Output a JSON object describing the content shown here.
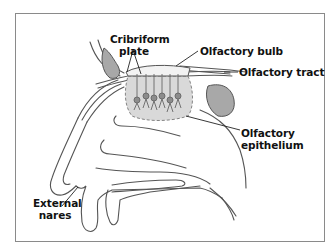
{
  "diagram": {
    "labels": {
      "cribriform_plate_line1": "Cribriform",
      "cribriform_plate_line2": "plate",
      "olfactory_bulb": "Olfactory bulb",
      "olfactory_tract": "Olfactory tract",
      "olfactory_epithelium_line1": "Olfactory",
      "olfactory_epithelium_line2": "epithelium",
      "external_nares_line1": "External",
      "external_nares_line2": "nares"
    },
    "colors": {
      "outline": "#555555",
      "sinus_fill": "#a8a8a8",
      "epithelium_fill": "#d9d9d9",
      "neuron_fill": "#8c8c8c",
      "border": "#8a8a8a",
      "text": "#111111"
    }
  }
}
